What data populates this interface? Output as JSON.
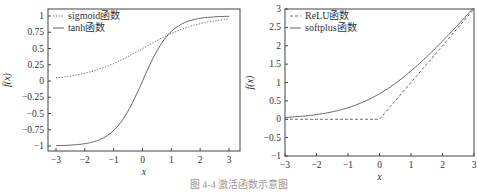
{
  "caption": "图 4-4  激活函数示意图",
  "chart_data": [
    {
      "type": "line",
      "title": "",
      "xlabel": "x",
      "ylabel": "f(x)",
      "xlim": [
        -3,
        3
      ],
      "ylim": [
        -1.1,
        1.05
      ],
      "xticks": [
        "−3",
        "−2",
        "−1",
        "0",
        "1",
        "2",
        "3"
      ],
      "yticks": [
        "−1",
        "−0.75",
        "−0.5",
        "−0.25",
        "0",
        "0.25",
        "0.5",
        "0.75",
        "1"
      ],
      "legend_position": "upper left",
      "grid": false,
      "x": [
        -3,
        -2.5,
        -2,
        -1.5,
        -1,
        -0.5,
        0,
        0.5,
        1,
        1.5,
        2,
        2.5,
        3
      ],
      "series": [
        {
          "name": "sigmoid函数",
          "style": "dotted",
          "values": [
            0.047,
            0.076,
            0.119,
            0.182,
            0.269,
            0.378,
            0.5,
            0.622,
            0.731,
            0.818,
            0.881,
            0.924,
            0.953
          ]
        },
        {
          "name": "tanh函数",
          "style": "solid",
          "values": [
            -0.995,
            -0.987,
            -0.964,
            -0.905,
            -0.762,
            -0.462,
            0,
            0.462,
            0.762,
            0.905,
            0.964,
            0.987,
            0.995
          ]
        }
      ]
    },
    {
      "type": "line",
      "title": "",
      "xlabel": "x",
      "ylabel": "f(x)",
      "xlim": [
        -3,
        3
      ],
      "ylim": [
        -1,
        3
      ],
      "xticks": [
        "−3",
        "−2",
        "−1",
        "0",
        "1",
        "2",
        "3"
      ],
      "yticks": [
        "−1",
        "−0.5",
        "0",
        "0.5",
        "1",
        "1.5",
        "2",
        "2.5",
        "3"
      ],
      "legend_position": "upper left",
      "grid": false,
      "x": [
        -3,
        -2.5,
        -2,
        -1.5,
        -1,
        -0.5,
        0,
        0.5,
        1,
        1.5,
        2,
        2.5,
        3
      ],
      "series": [
        {
          "name": "ReLU函数",
          "style": "dashed",
          "values": [
            0,
            0,
            0,
            0,
            0,
            0,
            0,
            0.5,
            1,
            1.5,
            2,
            2.5,
            3
          ]
        },
        {
          "name": "softplus函数",
          "style": "solid",
          "values": [
            0.049,
            0.079,
            0.127,
            0.201,
            0.313,
            0.474,
            0.693,
            0.974,
            1.313,
            1.701,
            2.127,
            2.579,
            3.049
          ]
        }
      ]
    }
  ]
}
